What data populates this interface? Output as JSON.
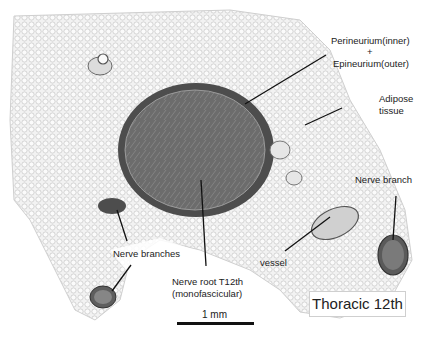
{
  "figure": {
    "title_box": "Thoracic 12th",
    "scale_bar": {
      "label": "1 mm"
    },
    "labels": {
      "perineurium": "Perineurium(inner)",
      "plus": "+",
      "epineurium": "Epineurium(outer)",
      "adipose_1": "Adipose",
      "adipose_2": "tissue",
      "nerve_branch": "Nerve branch",
      "nerve_branches": "Nerve branches",
      "nerve_root_1": "Nerve root T12th",
      "nerve_root_2": "(monofascicular)",
      "vessel": "vessel"
    },
    "colors": {
      "background": "#ffffff",
      "tissue": "#e9e9e9",
      "nerve_fill": "#6e6e6e",
      "nerve_rim": "#4a4a4a",
      "text": "#222222"
    }
  }
}
